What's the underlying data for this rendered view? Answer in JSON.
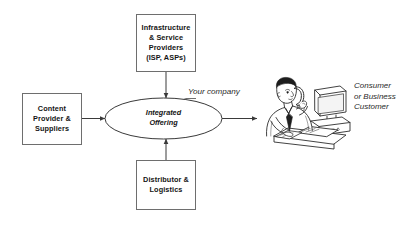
{
  "diagram": {
    "background_color": "#ffffff",
    "line_color": "#4a4a4a",
    "text_color": "#141414",
    "nodes": {
      "infrastructure": {
        "label": "Infrastructure\n& Service\nProviders\n(ISP, ASPs)",
        "shape": "rectangle"
      },
      "content": {
        "label": "Content\nProvider &\nSuppliers",
        "shape": "rectangle"
      },
      "distributor": {
        "label": "Distributor &\nLogistics",
        "shape": "rectangle"
      },
      "integrated": {
        "label": "Integrated\nOffering",
        "shape": "ellipse"
      }
    },
    "annotations": {
      "your_company": "Your company",
      "customer": "Consumer\nor Business\nCustomer"
    },
    "illustration": {
      "name": "person-at-desk-with-computer-and-phone",
      "description": "Line art of a businessman on the telephone sitting at a desk with a desktop computer and keyboard"
    },
    "arrows": [
      {
        "name": "content-to-integrated",
        "from": "content",
        "to": "integrated",
        "direction": "right"
      },
      {
        "name": "infrastructure-to-integrated",
        "from": "infrastructure",
        "to": "integrated",
        "direction": "down"
      },
      {
        "name": "distributor-to-integrated",
        "from": "distributor",
        "to": "integrated",
        "direction": "up"
      },
      {
        "name": "integrated-to-customer",
        "from": "integrated",
        "to": "customer",
        "direction": "right"
      }
    ]
  }
}
